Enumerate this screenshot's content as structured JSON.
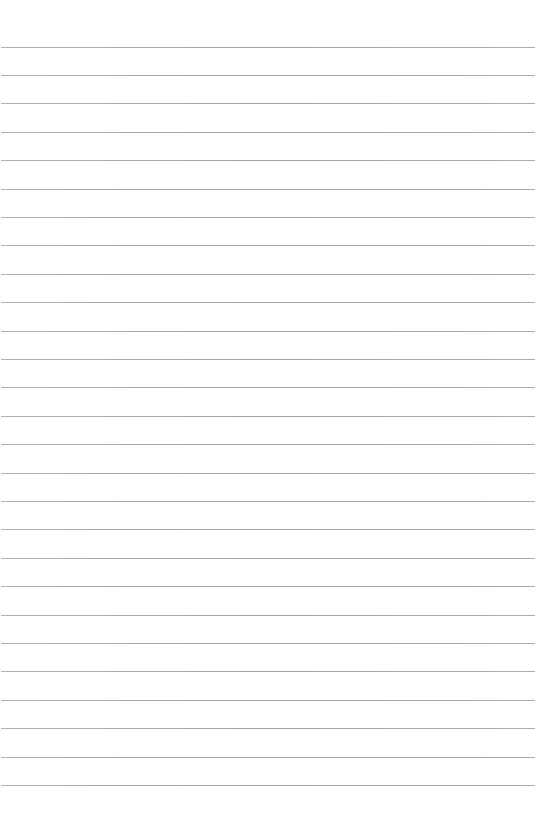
{
  "paper": {
    "type": "lined-paper",
    "background_color": "#ffffff",
    "line_color": "#9e9e9e",
    "line_count": 27,
    "first_line_y": 46.5,
    "line_spacing": 28.4,
    "line_left": 1,
    "line_width": 534
  }
}
